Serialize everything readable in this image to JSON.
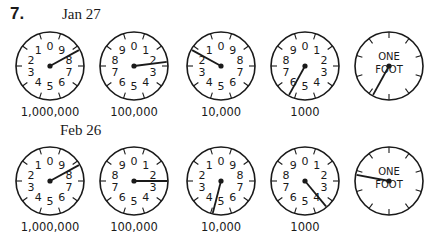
{
  "problem": {
    "number": "7.",
    "readings": [
      {
        "date": "Jan 27",
        "dials": [
          {
            "caption": "1,000,000",
            "direction": "ccw",
            "pointer_value": 8.3
          },
          {
            "caption": "100,000",
            "direction": "cw",
            "pointer_value": 2.3
          },
          {
            "caption": "10,000",
            "direction": "ccw",
            "pointer_value": 1.7
          },
          {
            "caption": "1000",
            "direction": "cw",
            "pointer_value": 5.8
          },
          {
            "caption": "",
            "label_line1": "ONE",
            "label_line2": "FOOT",
            "direction": "cw",
            "pointer_value": 5.8
          }
        ]
      },
      {
        "date": "Feb 26",
        "dials": [
          {
            "caption": "1,000,000",
            "direction": "ccw",
            "pointer_value": 8.3
          },
          {
            "caption": "100,000",
            "direction": "cw",
            "pointer_value": 2.5
          },
          {
            "caption": "10,000",
            "direction": "ccw",
            "pointer_value": 4.6
          },
          {
            "caption": "1000",
            "direction": "cw",
            "pointer_value": 3.9
          },
          {
            "caption": "",
            "label_line1": "ONE",
            "label_line2": "FOOT",
            "direction": "cw",
            "pointer_value": 7.8
          }
        ]
      }
    ]
  },
  "colors": {
    "ink": "#1a1a1a",
    "paper": "#ffffff"
  }
}
